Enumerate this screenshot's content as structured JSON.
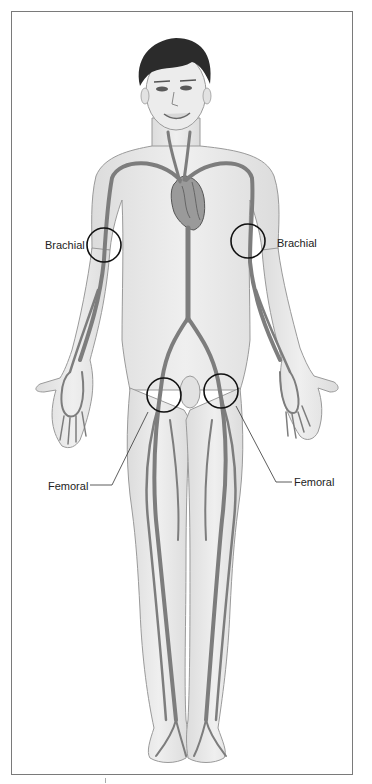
{
  "figure": {
    "labels": {
      "brachial_left": "Brachial",
      "brachial_right": "Brachial",
      "femoral_left": "Femoral",
      "femoral_right": "Femoral"
    },
    "colors": {
      "frame": "#7a7a7a",
      "skin": "#e9e9e9",
      "skin_outline": "#9a9a9a",
      "artery": "#7d7d7d",
      "hair": "#2b2b2b",
      "marker_circle": "#111111",
      "heart": "#8c8c8c"
    },
    "markers": [
      {
        "name": "brachial-left",
        "cx": 104,
        "cy": 245,
        "r": 17
      },
      {
        "name": "brachial-right",
        "cx": 248,
        "cy": 241,
        "r": 17
      },
      {
        "name": "femoral-left",
        "cx": 164,
        "cy": 395,
        "r": 17
      },
      {
        "name": "femoral-right",
        "cx": 221,
        "cy": 391,
        "r": 17
      }
    ]
  }
}
